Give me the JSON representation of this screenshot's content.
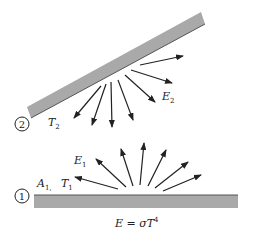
{
  "diagram": {
    "colors": {
      "plate": "#a9a9a9",
      "plate_edge": "#555555",
      "arrow": "#222222",
      "text": "#222222"
    },
    "surface2": {
      "number": "2",
      "temperature": {
        "main": "T",
        "sub": "2"
      },
      "emission": {
        "main": "E",
        "sub": "2"
      }
    },
    "surface1": {
      "number": "1",
      "area": {
        "main": "A",
        "sub": "1,"
      },
      "temperature": {
        "main": "T",
        "sub": "1"
      },
      "emission": {
        "main": "E",
        "sub": "1"
      }
    },
    "equation": {
      "lhs": "E = σT",
      "exp": "4"
    }
  }
}
